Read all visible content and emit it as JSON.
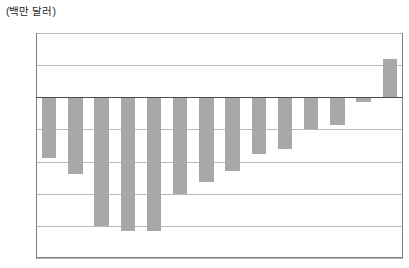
{
  "chart_data": {
    "type": "bar",
    "title": "",
    "subtitle": "",
    "unit_label": "(백만 달러)",
    "xlabel": "",
    "ylabel": "",
    "categories": [
      "1",
      "2",
      "3",
      "4",
      "5",
      "6",
      "7",
      "8",
      "9",
      "10",
      "11",
      "12",
      "13",
      "14"
    ],
    "tick_labels": [],
    "values": [
      -38,
      -48,
      -80,
      -83,
      -83,
      -60,
      -53,
      -46,
      -35,
      -32,
      -20,
      -17,
      -3,
      24
    ],
    "ylim": [
      -100,
      40
    ],
    "ytick_labels": [
      "40",
      "20",
      "0",
      "-20",
      "-40",
      "-60",
      "-80",
      "-100"
    ],
    "ytick_values": [
      40,
      20,
      0,
      -20,
      -40,
      -60,
      -80,
      -100
    ],
    "grid": true,
    "legend": null,
    "legend_position": "none",
    "bar_color": "#a8a8a8",
    "gridline_color": "#b9b9b9",
    "zero_line_color": "#4d4d4d",
    "frame_color": "#7f7f7f",
    "text_color": "#231f20",
    "background_color": "#ffffff"
  }
}
